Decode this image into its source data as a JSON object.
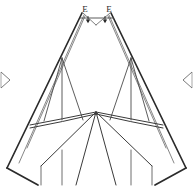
{
  "figure": {
    "kind": "structural-frame-diagram",
    "background_color": "#ffffff",
    "line_color": "#2b2b2b",
    "light_line_color": "#6b6b6b",
    "caption_color": "#c9c9c9",
    "caption_text": "",
    "labels": {
      "load_left": "E",
      "load_right": "E"
    },
    "annotations": {
      "arrow_count": 2,
      "support_marker_left": "chevron-right-support",
      "support_marker_right": "chevron-left-support"
    },
    "geometry": {
      "apex_left": [
        83,
        14
      ],
      "apex_right": [
        110,
        14
      ],
      "apex_mid": [
        96,
        24
      ],
      "base_left": [
        10,
        172
      ],
      "base_right": [
        183,
        172
      ],
      "center_node": [
        96,
        112
      ],
      "left_post_top": [
        62,
        58
      ],
      "right_post_top": [
        131,
        58
      ],
      "tie_left": [
        38,
        122
      ],
      "tie_right": [
        155,
        122
      ]
    }
  }
}
